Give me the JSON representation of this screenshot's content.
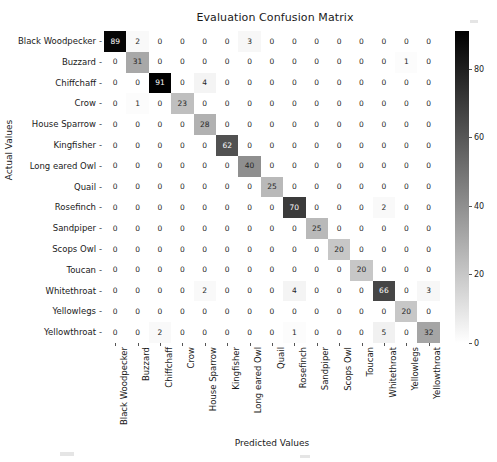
{
  "chart_data": {
    "type": "heatmap",
    "title": "Evaluation Confusion Matrix",
    "xlabel": "Predicted Values",
    "ylabel": "Actual Values",
    "categories": [
      "Black Woodpecker",
      "Buzzard",
      "Chiffchaff",
      "Crow",
      "House Sparrow",
      "Kingfisher",
      "Long eared Owl",
      "Quail",
      "Rosefinch",
      "Sandpiper",
      "Scops Owl",
      "Toucan",
      "Whitethroat",
      "Yellowlegs",
      "Yellowthroat"
    ],
    "x_categories": [
      "Black Woodpecker",
      "Buzzard",
      "Chiffchaff",
      "Crow",
      "House Sparrow",
      "Kingfisher",
      "Long eared Owl",
      "Quail",
      "Rosefinch",
      "Sandpiper",
      "Scops Owl",
      "Toucan",
      "Whitethroat",
      "Yellowlegs",
      "Yellowthroat"
    ],
    "values": [
      [
        89,
        2,
        0,
        0,
        0,
        0,
        3,
        0,
        0,
        0,
        0,
        0,
        0,
        0,
        0
      ],
      [
        0,
        31,
        0,
        0,
        0,
        0,
        0,
        0,
        0,
        0,
        0,
        0,
        0,
        1,
        0
      ],
      [
        0,
        0,
        91,
        0,
        4,
        0,
        0,
        0,
        0,
        0,
        0,
        0,
        0,
        0,
        0
      ],
      [
        0,
        1,
        0,
        23,
        0,
        0,
        0,
        0,
        0,
        0,
        0,
        0,
        0,
        0,
        0
      ],
      [
        0,
        0,
        0,
        0,
        28,
        0,
        0,
        0,
        0,
        0,
        0,
        0,
        0,
        0,
        0
      ],
      [
        0,
        0,
        0,
        0,
        0,
        62,
        0,
        0,
        0,
        0,
        0,
        0,
        0,
        0,
        0
      ],
      [
        0,
        0,
        0,
        0,
        0,
        0,
        40,
        0,
        0,
        0,
        0,
        0,
        0,
        0,
        0
      ],
      [
        0,
        0,
        0,
        0,
        0,
        0,
        0,
        25,
        0,
        0,
        0,
        0,
        0,
        0,
        0
      ],
      [
        0,
        0,
        0,
        0,
        0,
        0,
        0,
        0,
        70,
        0,
        0,
        0,
        2,
        0,
        0
      ],
      [
        0,
        0,
        0,
        0,
        0,
        0,
        0,
        0,
        0,
        25,
        0,
        0,
        0,
        0,
        0
      ],
      [
        0,
        0,
        0,
        0,
        0,
        0,
        0,
        0,
        0,
        0,
        20,
        0,
        0,
        0,
        0
      ],
      [
        0,
        0,
        0,
        0,
        0,
        0,
        0,
        0,
        0,
        0,
        0,
        20,
        0,
        0,
        0
      ],
      [
        0,
        0,
        0,
        0,
        2,
        0,
        0,
        0,
        4,
        0,
        0,
        0,
        66,
        0,
        3
      ],
      [
        0,
        0,
        0,
        0,
        0,
        0,
        0,
        0,
        0,
        0,
        0,
        0,
        0,
        20,
        0
      ],
      [
        0,
        0,
        2,
        0,
        0,
        0,
        0,
        0,
        1,
        0,
        0,
        0,
        5,
        0,
        32
      ]
    ],
    "colorbar": {
      "ticks": [
        0,
        20,
        40,
        60,
        80
      ],
      "vmin": 0,
      "vmax": 91,
      "colormap": "gray_reversed",
      "dark_color": "#000000",
      "light_color": "#ffffff"
    },
    "grid": false,
    "legend_position": "right-colorbar"
  }
}
